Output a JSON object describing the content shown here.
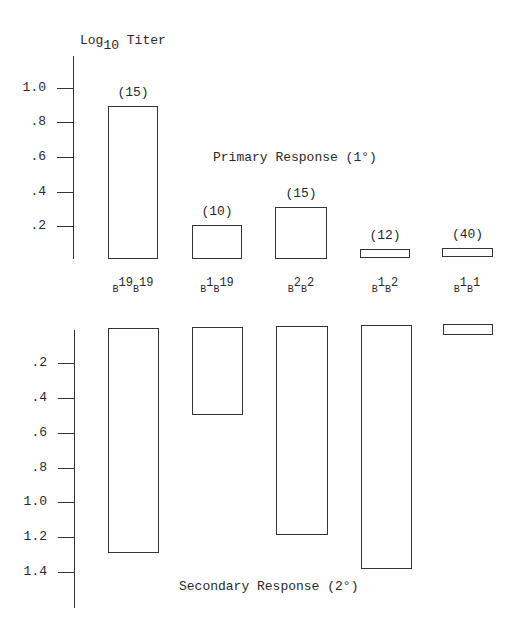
{
  "chart_data": [
    {
      "type": "bar",
      "title": "Primary Response (1°)",
      "ylabel": "Log10 Titer",
      "categories": [
        "B19B19",
        "B1B19",
        "B2B2",
        "B1B2",
        "B1B1"
      ],
      "values": [
        0.9,
        0.2,
        0.3,
        0.04,
        0.04
      ],
      "counts": [
        "(15)",
        "(10)",
        "(15)",
        "(12)",
        "(40)"
      ],
      "yticks": [
        "1.0",
        ".8",
        ".6",
        ".4",
        ".2"
      ],
      "ylim": [
        0,
        1.1
      ],
      "grid": false
    },
    {
      "type": "bar",
      "title": "Secondary Response (2°)",
      "ylabel": "Log10 Titer",
      "orientation": "inverted (bars hang downward)",
      "categories": [
        "B19B19",
        "B1B19",
        "B2B2",
        "B1B2",
        "B1B1"
      ],
      "values": [
        1.3,
        0.5,
        1.2,
        1.4,
        0.05
      ],
      "yticks": [
        ".2",
        ".4",
        ".6",
        ".8",
        "1.0",
        "1.2",
        "1.4"
      ],
      "ylim": [
        0,
        1.6
      ],
      "grid": false
    }
  ],
  "axis_title": {
    "base": "Log",
    "sub": "10",
    "rest": " Titer"
  },
  "primary": {
    "label": "Primary Response (1°)",
    "ticks": [
      {
        "label": "1.0",
        "y": 88
      },
      {
        "label": ".8",
        "y": 122
      },
      {
        "label": ".6",
        "y": 157
      },
      {
        "label": ".4",
        "y": 192
      },
      {
        "label": ".2",
        "y": 226
      }
    ],
    "bars": [
      {
        "x": 108,
        "w": 50,
        "top": 106,
        "bottom": 259,
        "count": "(15)"
      },
      {
        "x": 192,
        "w": 50,
        "top": 225,
        "bottom": 259,
        "count": "(10)"
      },
      {
        "x": 275,
        "w": 52,
        "top": 207,
        "bottom": 259,
        "count": "(15)"
      },
      {
        "x": 360,
        "w": 50,
        "top": 249,
        "bottom": 258,
        "count": "(12)"
      },
      {
        "x": 442,
        "w": 51,
        "top": 248,
        "bottom": 257,
        "count": "(40)"
      }
    ]
  },
  "categories": [
    {
      "cx": 133,
      "a": "19",
      "b": "19"
    },
    {
      "cx": 217,
      "a": "1",
      "b": "19"
    },
    {
      "cx": 301,
      "a": "2",
      "b": "2"
    },
    {
      "cx": 385,
      "a": "1",
      "b": "2"
    },
    {
      "cx": 467,
      "a": "1",
      "b": "1"
    }
  ],
  "secondary": {
    "label": "Secondary Response (2°)",
    "ticks": [
      {
        "label": ".2",
        "y": 363
      },
      {
        "label": ".4",
        "y": 398
      },
      {
        "label": ".6",
        "y": 433
      },
      {
        "label": ".8",
        "y": 468
      },
      {
        "label": "1.0",
        "y": 502
      },
      {
        "label": "1.2",
        "y": 537
      },
      {
        "label": "1.4",
        "y": 572
      }
    ],
    "bars": [
      {
        "x": 108,
        "w": 51,
        "top": 328,
        "bottom": 553
      },
      {
        "x": 192,
        "w": 51,
        "top": 327,
        "bottom": 415
      },
      {
        "x": 276,
        "w": 52,
        "top": 326,
        "bottom": 535
      },
      {
        "x": 361,
        "w": 51,
        "top": 325,
        "bottom": 569
      },
      {
        "x": 443,
        "w": 50,
        "top": 324,
        "bottom": 335
      }
    ]
  }
}
